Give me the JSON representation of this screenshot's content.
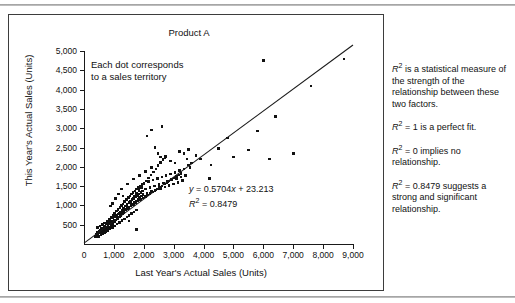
{
  "chart_data": {
    "type": "scatter",
    "title": "Product A",
    "xlabel": "Last Year's Actual Sales (Units)",
    "ylabel": "This Year's Actual Sales (Units)",
    "xlim": [
      0,
      9000
    ],
    "ylim": [
      0,
      5000
    ],
    "xticks": [
      "0",
      "1,000",
      "2,000",
      "3,000",
      "4,000",
      "5,000",
      "6,000",
      "7,000",
      "8,000",
      "9,000"
    ],
    "xtick_values": [
      0,
      1000,
      2000,
      3000,
      4000,
      5000,
      6000,
      7000,
      8000,
      9000
    ],
    "yticks": [
      "500",
      "1,000",
      "1,500",
      "2,000",
      "2,500",
      "3,000",
      "3,500",
      "4,000",
      "4,500",
      "5,000"
    ],
    "ytick_values": [
      500,
      1000,
      1500,
      2000,
      2500,
      3000,
      3500,
      4000,
      4500,
      5000
    ],
    "grid": false,
    "legend": null,
    "annotation": "Each dot corresponds to a sales territory",
    "trendline": {
      "equation": "y = 0.5704x + 23.213",
      "r_squared_label": "R2 = 0.8479",
      "slope": 0.5704,
      "intercept": 23.213,
      "r_squared": 0.8479,
      "x_range": [
        0,
        9000
      ]
    },
    "points": [
      [
        380,
        190
      ],
      [
        410,
        250
      ],
      [
        430,
        210
      ],
      [
        450,
        300
      ],
      [
        470,
        240
      ],
      [
        500,
        330
      ],
      [
        520,
        280
      ],
      [
        540,
        360
      ],
      [
        560,
        300
      ],
      [
        580,
        420
      ],
      [
        600,
        350
      ],
      [
        620,
        400
      ],
      [
        640,
        330
      ],
      [
        660,
        450
      ],
      [
        680,
        380
      ],
      [
        700,
        470
      ],
      [
        720,
        400
      ],
      [
        740,
        520
      ],
      [
        760,
        440
      ],
      [
        780,
        560
      ],
      [
        800,
        480
      ],
      [
        810,
        420
      ],
      [
        830,
        600
      ],
      [
        850,
        520
      ],
      [
        870,
        640
      ],
      [
        890,
        560
      ],
      [
        900,
        480
      ],
      [
        910,
        700
      ],
      [
        930,
        600
      ],
      [
        950,
        680
      ],
      [
        970,
        560
      ],
      [
        990,
        740
      ],
      [
        1000,
        620
      ],
      [
        1020,
        800
      ],
      [
        1040,
        700
      ],
      [
        1060,
        620
      ],
      [
        1080,
        860
      ],
      [
        1100,
        740
      ],
      [
        1120,
        660
      ],
      [
        1140,
        900
      ],
      [
        1160,
        780
      ],
      [
        1180,
        700
      ],
      [
        1200,
        950
      ],
      [
        1210,
        820
      ],
      [
        1230,
        740
      ],
      [
        1250,
        1000
      ],
      [
        1270,
        880
      ],
      [
        1290,
        780
      ],
      [
        1300,
        1040
      ],
      [
        1320,
        920
      ],
      [
        1340,
        820
      ],
      [
        1360,
        1100
      ],
      [
        1380,
        980
      ],
      [
        1400,
        880
      ],
      [
        1420,
        1150
      ],
      [
        1440,
        1020
      ],
      [
        1460,
        920
      ],
      [
        1480,
        1200
      ],
      [
        1500,
        1060
      ],
      [
        1510,
        960
      ],
      [
        1530,
        1240
      ],
      [
        1550,
        1100
      ],
      [
        1570,
        1000
      ],
      [
        1590,
        1300
      ],
      [
        1600,
        1140
      ],
      [
        1620,
        1040
      ],
      [
        1640,
        1340
      ],
      [
        1660,
        1180
      ],
      [
        1680,
        1080
      ],
      [
        1700,
        1380
      ],
      [
        1720,
        1220
      ],
      [
        1740,
        1120
      ],
      [
        1760,
        1420
      ],
      [
        1780,
        1260
      ],
      [
        1800,
        1160
      ],
      [
        1820,
        1460
      ],
      [
        1840,
        1300
      ],
      [
        1860,
        1200
      ],
      [
        1880,
        1500
      ],
      [
        1900,
        1340
      ],
      [
        1920,
        1240
      ],
      [
        1940,
        1540
      ],
      [
        1960,
        1380
      ],
      [
        1980,
        1280
      ],
      [
        2000,
        1580
      ],
      [
        2050,
        1420
      ],
      [
        2100,
        1320
      ],
      [
        2150,
        1620
      ],
      [
        2200,
        1460
      ],
      [
        2250,
        1360
      ],
      [
        2300,
        1660
      ],
      [
        2350,
        1500
      ],
      [
        2400,
        1400
      ],
      [
        2450,
        1700
      ],
      [
        2500,
        1540
      ],
      [
        2550,
        1440
      ],
      [
        2600,
        1740
      ],
      [
        2650,
        1580
      ],
      [
        2700,
        1480
      ],
      [
        2750,
        1780
      ],
      [
        2800,
        1620
      ],
      [
        2850,
        1520
      ],
      [
        2900,
        1820
      ],
      [
        2950,
        1660
      ],
      [
        3000,
        1560
      ],
      [
        3050,
        1860
      ],
      [
        3100,
        1700
      ],
      [
        3150,
        1600
      ],
      [
        3200,
        1900
      ],
      [
        3250,
        1740
      ],
      [
        3300,
        1640
      ],
      [
        3350,
        1940
      ],
      [
        3400,
        1780
      ],
      [
        3450,
        2200
      ],
      [
        3500,
        2050
      ],
      [
        3550,
        1980
      ],
      [
        2550,
        2250
      ],
      [
        2700,
        2230
      ],
      [
        2900,
        2150
      ],
      [
        3050,
        2100
      ],
      [
        3200,
        2400
      ],
      [
        3350,
        2350
      ],
      [
        3500,
        2450
      ],
      [
        2380,
        2500
      ],
      [
        2480,
        2350
      ],
      [
        3600,
        2100
      ],
      [
        3750,
        2300
      ],
      [
        3900,
        2200
      ],
      [
        4200,
        1700
      ],
      [
        4250,
        2050
      ],
      [
        4500,
        2480
      ],
      [
        4800,
        2750
      ],
      [
        5000,
        2250
      ],
      [
        5500,
        2440
      ],
      [
        5800,
        2930
      ],
      [
        6000,
        4750
      ],
      [
        6200,
        2200
      ],
      [
        6400,
        3300
      ],
      [
        7000,
        2350
      ],
      [
        7600,
        4100
      ],
      [
        8700,
        4800
      ],
      [
        2100,
        2800
      ],
      [
        2250,
        2950
      ],
      [
        2600,
        3050
      ],
      [
        1500,
        600
      ],
      [
        1600,
        1150
      ],
      [
        1750,
        380
      ],
      [
        1300,
        1250
      ],
      [
        1150,
        1300
      ],
      [
        950,
        1050
      ],
      [
        880,
        980
      ],
      [
        1050,
        1180
      ],
      [
        1250,
        1420
      ],
      [
        1450,
        1550
      ],
      [
        1650,
        1680
      ],
      [
        1850,
        1780
      ],
      [
        2050,
        1880
      ],
      [
        2250,
        1980
      ],
      [
        620,
        260
      ],
      [
        700,
        300
      ],
      [
        790,
        340
      ],
      [
        870,
        390
      ],
      [
        950,
        430
      ],
      [
        1030,
        470
      ],
      [
        1110,
        520
      ],
      [
        1190,
        560
      ],
      [
        1270,
        610
      ],
      [
        1350,
        650
      ],
      [
        1430,
        700
      ],
      [
        1510,
        740
      ],
      [
        1590,
        790
      ],
      [
        1670,
        830
      ],
      [
        1750,
        880
      ],
      [
        480,
        200
      ],
      [
        560,
        230
      ],
      [
        640,
        270
      ],
      [
        720,
        310
      ],
      [
        800,
        350
      ],
      [
        880,
        430
      ],
      [
        960,
        510
      ],
      [
        1040,
        590
      ],
      [
        1120,
        670
      ],
      [
        1200,
        750
      ],
      [
        1280,
        830
      ],
      [
        1360,
        910
      ],
      [
        1440,
        990
      ],
      [
        1520,
        1070
      ],
      [
        1600,
        1150
      ],
      [
        1680,
        1230
      ],
      [
        1760,
        1310
      ],
      [
        1840,
        1390
      ],
      [
        1920,
        1470
      ],
      [
        2000,
        1550
      ],
      [
        2080,
        1630
      ],
      [
        2160,
        1710
      ],
      [
        2240,
        1790
      ],
      [
        2320,
        1870
      ],
      [
        2400,
        1950
      ],
      [
        2480,
        2030
      ],
      [
        2560,
        2110
      ],
      [
        2640,
        2190
      ],
      [
        2720,
        2270
      ],
      [
        450,
        430
      ],
      [
        530,
        470
      ],
      [
        610,
        510
      ],
      [
        690,
        550
      ],
      [
        770,
        590
      ],
      [
        850,
        630
      ],
      [
        930,
        670
      ],
      [
        1010,
        710
      ],
      [
        1090,
        750
      ],
      [
        1170,
        790
      ],
      [
        1250,
        830
      ],
      [
        1330,
        870
      ],
      [
        1410,
        910
      ],
      [
        1490,
        950
      ],
      [
        1570,
        990
      ],
      [
        1650,
        1030
      ],
      [
        1730,
        1070
      ],
      [
        1810,
        1110
      ],
      [
        1890,
        1150
      ],
      [
        1970,
        1190
      ],
      [
        2050,
        1230
      ],
      [
        2130,
        1270
      ],
      [
        2210,
        1310
      ],
      [
        2290,
        1350
      ],
      [
        2370,
        1390
      ],
      [
        2450,
        1430
      ],
      [
        2530,
        1470
      ],
      [
        2610,
        1510
      ],
      [
        2690,
        1550
      ],
      [
        2770,
        1590
      ],
      [
        2850,
        1630
      ],
      [
        2930,
        1670
      ],
      [
        3010,
        1710
      ],
      [
        3090,
        1750
      ],
      [
        3170,
        1790
      ],
      [
        3250,
        1830
      ]
    ]
  },
  "explanation": {
    "paragraphs": [
      "R2 is a statistical measure of the strength of the relationship between these two factors.",
      "R2 = 1 is a perfect fit.",
      "R2 = 0 implies no relationship.",
      "R2 = 0.8479 suggests a strong and significant relationship."
    ]
  }
}
